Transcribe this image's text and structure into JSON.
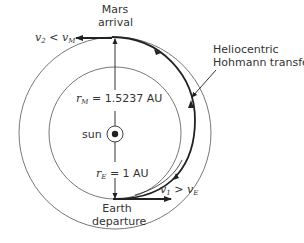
{
  "diagram": {
    "labels": {
      "mars_arrival_line1": "Mars",
      "mars_arrival_line2": "arrival",
      "earth_departure_line1": "Earth",
      "earth_departure_line2": "departure",
      "transfer_line1": "Heliocentric",
      "transfer_line2": "Hohmann transfer",
      "sun": "sun",
      "r_mars_symbol": "r",
      "r_mars_sub": "M",
      "r_mars_value": " = 1.5237 AU",
      "r_earth_symbol": "r",
      "r_earth_sub": "E",
      "r_earth_value": " = 1 AU",
      "v2_symbol": "v",
      "v2_sub": "2",
      "v2_rel": " < v",
      "v2_rel_sub": "M",
      "v1_symbol": "v",
      "v1_sub": "1",
      "v1_rel": " > v",
      "v1_rel_sub": "E"
    },
    "geometry": {
      "sun_center": [
        115,
        133
      ],
      "earth_orbit_radius_px": 66,
      "mars_orbit_radius_px": 96,
      "earth_orbit_radius_AU": 1,
      "mars_orbit_radius_AU": 1.5237
    },
    "colors": {
      "orbit": "#777777",
      "transfer": "#222222",
      "text": "#333333"
    }
  }
}
